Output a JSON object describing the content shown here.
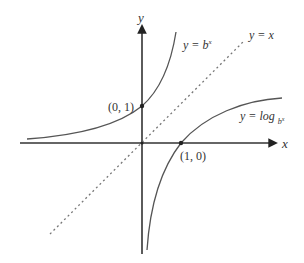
{
  "diagram": {
    "axes": {
      "x_label": "x",
      "y_label": "y"
    },
    "curves": [
      {
        "name": "exponential",
        "label_prefix": "y = ",
        "label_base": "b",
        "label_sup": "x"
      },
      {
        "name": "identity",
        "label": "y = x"
      },
      {
        "name": "logarithm",
        "label_prefix": "y = log ",
        "label_sub": "b",
        "label_sub_arg": "x"
      }
    ],
    "points": [
      {
        "label": "(0, 1)",
        "x": 0,
        "y": 1
      },
      {
        "label": "(1, 0)",
        "x": 1,
        "y": 0
      }
    ],
    "colors": {
      "axis": "#333333",
      "curve": "#555555",
      "dotted": "#777777",
      "text": "#333333"
    }
  }
}
